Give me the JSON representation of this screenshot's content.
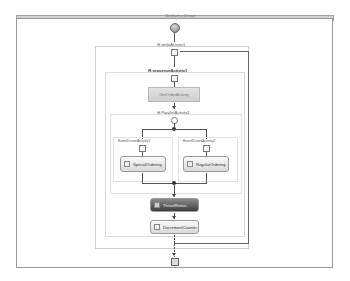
{
  "window": {
    "title": "Workflow1.cs [Design]"
  },
  "workflow": {
    "start_node": "start-icon",
    "while": {
      "label": "whileActivity1"
    },
    "sequence": {
      "label": "sequenceActivity1"
    },
    "get_order": {
      "label": "GetOrderActivity"
    },
    "parallel": {
      "label": "ParallelActivity1"
    },
    "branches": [
      {
        "label": "EventDrivenActivity1",
        "activity": "SpecialOrdering"
      },
      {
        "label": "EventDrivenActivity2",
        "activity": "RegularOrdering"
      }
    ],
    "throw": {
      "label": "ThrowWorker"
    },
    "decrement": {
      "label": "DecrementCounter"
    },
    "end_node": "end-icon"
  },
  "colors": {
    "frame": "#9a9a9a",
    "connector": "#555555",
    "dark_activity": "#4a4a4a",
    "grey_activity": "#d6d6d6"
  }
}
